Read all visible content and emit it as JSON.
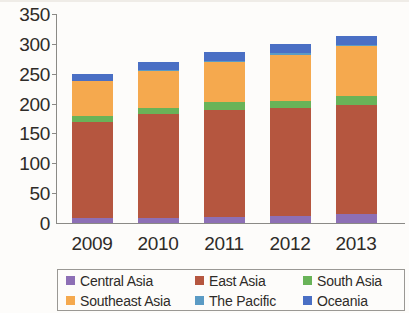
{
  "chart_data": {
    "type": "bar",
    "stacked": true,
    "title": "",
    "subtitle": "",
    "xlabel": "",
    "ylabel": "",
    "categories": [
      "2009",
      "2010",
      "2011",
      "2012",
      "2013"
    ],
    "ylim": [
      0,
      350
    ],
    "yticks": [
      0,
      50,
      100,
      150,
      200,
      250,
      300,
      350
    ],
    "ytick_labels": [
      "0",
      "50",
      "100",
      "150",
      "200",
      "250",
      "300",
      "350"
    ],
    "grid": false,
    "legend_position": "bottom",
    "series": [
      {
        "name": "Central Asia",
        "color": "#8d6fb5",
        "values": [
          8,
          8,
          10,
          12,
          15
        ]
      },
      {
        "name": "East Asia",
        "color": "#b5563f",
        "values": [
          162,
          175,
          180,
          180,
          183
        ]
      },
      {
        "name": "South Asia",
        "color": "#69b358",
        "values": [
          10,
          10,
          12,
          13,
          14
        ]
      },
      {
        "name": "Southeast Asia",
        "color": "#f5a94e",
        "values": [
          57,
          62,
          68,
          77,
          84
        ]
      },
      {
        "name": "The Pacific",
        "color": "#5b9bc4",
        "values": [
          1,
          1,
          1,
          2,
          2
        ]
      },
      {
        "name": "Oceania",
        "color": "#4a6fc4",
        "values": [
          12,
          13,
          15,
          15,
          15
        ]
      }
    ],
    "totals": [
      250,
      269,
      286,
      299,
      313
    ]
  },
  "legend": {
    "rows": [
      [
        "Central Asia",
        "East Asia",
        "South Asia"
      ],
      [
        "Southeast Asia",
        "The Pacific",
        "Oceania"
      ]
    ]
  }
}
